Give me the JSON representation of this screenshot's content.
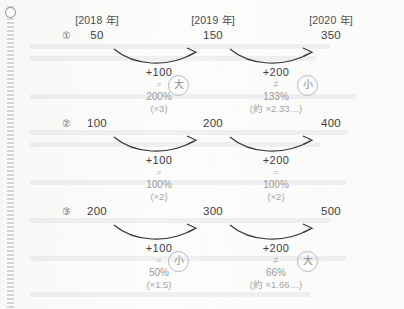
{
  "page": {
    "kind": "scanned-notebook-page",
    "binding": "spiral-left-edge",
    "ring_icon": "binding-ring-icon"
  },
  "columns": [
    {
      "header": "[2018 年]"
    },
    {
      "header": "[2019 年]"
    },
    {
      "header": "[2020 年]"
    }
  ],
  "rows": [
    {
      "number": "①",
      "values": [
        "50",
        "150",
        "350"
      ],
      "steps": [
        {
          "delta": "+100",
          "relation": "=",
          "percent": "200%",
          "multiplier": "(×3)",
          "badge": "大",
          "has_badge": true
        },
        {
          "delta": "+200",
          "relation": "≠",
          "percent": "133%",
          "multiplier": "(約 ×2.33…)",
          "badge": "小",
          "has_badge": true
        }
      ]
    },
    {
      "number": "②",
      "values": [
        "100",
        "200",
        "400"
      ],
      "steps": [
        {
          "delta": "+100",
          "relation": "=",
          "percent": "100%",
          "multiplier": "(×2)",
          "badge": "",
          "has_badge": false
        },
        {
          "delta": "+200",
          "relation": "=",
          "percent": "100%",
          "multiplier": "(×2)",
          "badge": "",
          "has_badge": false
        }
      ]
    },
    {
      "number": "③",
      "values": [
        "200",
        "300",
        "500"
      ],
      "steps": [
        {
          "delta": "+100",
          "relation": "=",
          "percent": "50%",
          "multiplier": "(×1.5)",
          "badge": "小",
          "has_badge": true
        },
        {
          "delta": "+200",
          "relation": "≠",
          "percent": "66%",
          "multiplier": "(約 ×1.66…)",
          "badge": "大",
          "has_badge": true
        }
      ]
    }
  ],
  "colors": {
    "paper": "#fbfbfa",
    "ink": "#3f3f41",
    "ink_light": "#9a9a9d",
    "badge_border": "#b9b9bb"
  }
}
